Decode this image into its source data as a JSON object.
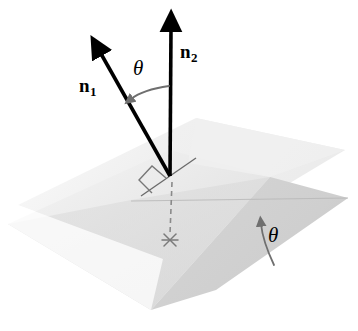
{
  "figure": {
    "background_color": "#ffffff",
    "width": 358,
    "height": 331
  },
  "labels": {
    "n1": {
      "base": "n",
      "subscript": "1",
      "text": "n1",
      "style": "bold-serif-italic-subscript"
    },
    "n2": {
      "base": "n",
      "subscript": "2",
      "text": "n2",
      "style": "bold-serif-italic-subscript"
    },
    "theta_between_normals": {
      "text": "θ",
      "style": "italic-serif"
    },
    "theta_between_planes": {
      "text": "θ",
      "style": "italic-serif"
    }
  },
  "colors": {
    "vector_stroke": "#000000",
    "plane_upper_light": "#f1f1f1",
    "plane_upper_far": "#ededed",
    "plane_lower_light": "#e9e9e9",
    "plane_lower_mid": "#dcdcdc",
    "plane_overlap_shade": "#d2d2d2",
    "plane_lower_dark": "#cccccc",
    "arc_stroke": "#6f6f6f",
    "dashed_stroke": "#8a8a8a",
    "right_angle_stroke": "#777777",
    "intersection_line": "#6a6a6a",
    "star_marker": "#7a7a7a"
  },
  "geometry": {
    "origin_point": {
      "x": 170,
      "y": 176
    },
    "n1_vector": {
      "from": {
        "x": 170,
        "y": 176
      },
      "to": {
        "x": 96,
        "y": 45
      },
      "arrowhead": "solid-triangle"
    },
    "n2_vector": {
      "from": {
        "x": 170,
        "y": 176
      },
      "to": {
        "x": 171,
        "y": 20
      },
      "arrowhead": "solid-triangle"
    },
    "dashed_drop_line": {
      "from": {
        "x": 172,
        "y": 182
      },
      "to": {
        "x": 170,
        "y": 236
      }
    },
    "star_marker_point": {
      "x": 170,
      "y": 240
    },
    "right_angle_marker": "parallelogram",
    "upper_plane_vertices": [
      [
        18,
        205
      ],
      [
        196,
        118
      ],
      [
        345,
        150
      ],
      [
        163,
        259
      ]
    ],
    "lower_plane_vertices": [
      [
        8,
        224
      ],
      [
        170,
        150
      ],
      [
        348,
        198
      ],
      [
        151,
        310
      ]
    ],
    "plane_intersection_line": {
      "from": {
        "x": 131,
        "y": 200
      },
      "to": {
        "x": 348,
        "y": 198
      }
    }
  },
  "annotations": {
    "arc_top_description": "curved gray arrow from n2 toward n1 marking angle theta between normals",
    "arc_bottom_description": "curved gray arrow marking dihedral angle theta between the two planes",
    "right_angle_description": "square marker showing n1 is perpendicular to the upper plane",
    "dashed_line_description": "dashed vertical projection line from origin down to the lower plane"
  }
}
